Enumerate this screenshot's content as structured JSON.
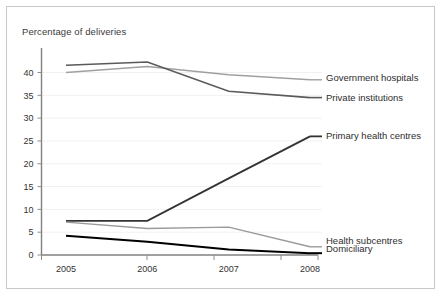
{
  "chart_data": {
    "type": "line",
    "title": "Percentage of deliveries",
    "xlabel": "",
    "ylabel": "",
    "categories": [
      "2005",
      "2006",
      "2007",
      "2008"
    ],
    "x": [
      2005,
      2006,
      2007,
      2008
    ],
    "ylim": [
      0,
      45
    ],
    "yticks": [
      0,
      5,
      10,
      15,
      20,
      25,
      30,
      35,
      40
    ],
    "ytick_labels": [
      "0",
      "5",
      "10",
      "15",
      "20",
      "25",
      "30",
      "35",
      "40"
    ],
    "grid": true,
    "legend_position": "right-inline-labels",
    "series": [
      {
        "name": "Government hospitals",
        "values": [
          40.0,
          41.3,
          39.5,
          38.4
        ],
        "color": "#a0a0a0",
        "width": 1.4
      },
      {
        "name": "Private institutions",
        "values": [
          41.6,
          42.3,
          35.9,
          34.5
        ],
        "color": "#5a5a5a",
        "width": 1.6
      },
      {
        "name": "Primary health centres",
        "values": [
          7.5,
          7.5,
          16.8,
          26.0
        ],
        "color": "#333333",
        "width": 1.8
      },
      {
        "name": "Health subcentres",
        "values": [
          7.2,
          5.8,
          6.1,
          1.8
        ],
        "color": "#9a9a9a",
        "width": 1.4
      },
      {
        "name": "Domiciliary",
        "values": [
          4.2,
          2.9,
          1.2,
          0.4
        ],
        "color": "#000000",
        "width": 2.0
      }
    ],
    "axis_color": "#808080",
    "grid_color": "#f1f1f1",
    "background": "#ffffff",
    "border_color": "#c9c9c9"
  }
}
